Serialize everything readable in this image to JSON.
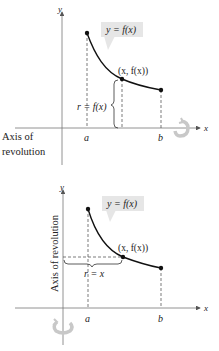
{
  "figures": [
    {
      "id": "rotation-about-x-axis",
      "axis_x_label": "x",
      "axis_y_label": "y",
      "curve_label": "y = f(x)",
      "point_label": "(x,  f(x))",
      "radius_label": "r = f(x)",
      "a_label": "a",
      "b_label": "b",
      "axis_of_revolution_line1": "Axis of",
      "axis_of_revolution_line2": "revolution"
    },
    {
      "id": "rotation-about-y-axis",
      "axis_x_label": "x",
      "axis_y_label": "y",
      "curve_label": "y = f(x)",
      "point_label": "(x,  f(x))",
      "radius_label": "r = x",
      "a_label": "a",
      "b_label": "b",
      "axis_of_revolution": "Axis of revolution"
    }
  ],
  "colors": {
    "ink": "#222222",
    "label_box": "#e6e6e6",
    "rotation_arrow": "#c8c8c8"
  }
}
